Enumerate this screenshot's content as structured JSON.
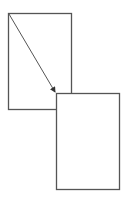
{
  "diagram": {
    "stroke_color": "#555555",
    "background": "#ffffff",
    "shapes": [
      {
        "id": "source-page",
        "x": 8.5,
        "y": 13.5,
        "width": 63,
        "height": 96
      },
      {
        "id": "target-page",
        "x": 56.5,
        "y": 93.5,
        "width": 63,
        "height": 96
      }
    ],
    "arrow": {
      "x1": 9,
      "y1": 14,
      "x2": 55,
      "y2": 92
    }
  }
}
